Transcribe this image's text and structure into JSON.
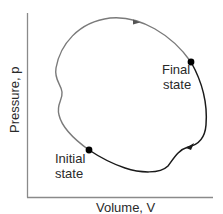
{
  "diagram": {
    "type": "pV-diagram",
    "axes": {
      "x_label": "Volume, V",
      "y_label": "Pressure, p",
      "color": "#8a8a8a"
    },
    "states": {
      "initial": {
        "label_line1": "Initial",
        "label_line2": "state",
        "x": 89,
        "y": 150
      },
      "final": {
        "label_line1": "Final",
        "label_line2": "state",
        "x": 191,
        "y": 62
      }
    },
    "paths": [
      {
        "name": "upper-path",
        "from": "initial",
        "to": "final",
        "color": "#7a7a7a",
        "direction": "clockwise over top"
      },
      {
        "name": "lower-path",
        "from": "final",
        "to": "initial",
        "color": "#1a1a1a",
        "direction": "down right side then left along bottom"
      }
    ],
    "colors": {
      "upper_path": "#7a7a7a",
      "lower_path": "#1a1a1a",
      "dot": "#000000",
      "text": "#2a2a2a"
    }
  }
}
